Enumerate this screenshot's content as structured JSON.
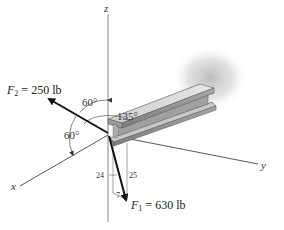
{
  "figure": {
    "type": "3d-force-vector-diagram",
    "axes": {
      "x": {
        "label": "x"
      },
      "y": {
        "label": "y"
      },
      "z": {
        "label": "z"
      }
    },
    "forces": [
      {
        "name": "F",
        "subscript": "2",
        "equals": "=",
        "magnitude": "250 lb"
      },
      {
        "name": "F",
        "subscript": "1",
        "equals": "=",
        "magnitude": "630 lb"
      }
    ],
    "angles": [
      {
        "value": "60°",
        "between": "F2 and z-axis"
      },
      {
        "value": "60°",
        "between": "F2 and x-axis"
      },
      {
        "value": "135°",
        "between": "F2 projection and y-axis"
      }
    ],
    "slope_triangle": {
      "vertical": "24",
      "hypotenuse": "25",
      "horizontal": "7"
    },
    "object": "I-beam (wide-flange) cantilevered from wall",
    "colors": {
      "arrow": "#111111",
      "axis_line": "#555555",
      "beam_top": "#d8d8d8",
      "beam_side": "#9a9a9a",
      "shadow": "#bdbdbd"
    }
  }
}
